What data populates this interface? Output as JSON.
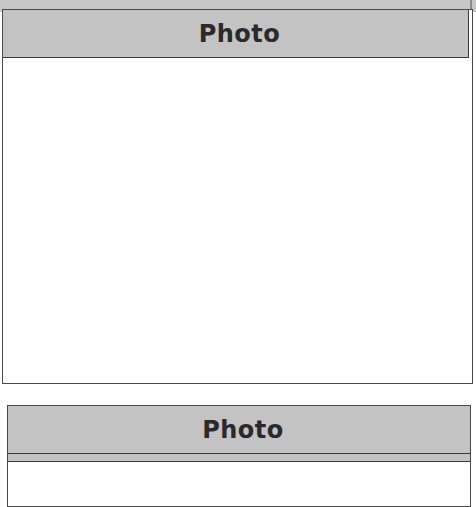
{
  "document": {
    "boxes": [
      {
        "header": "Photo",
        "content": ""
      },
      {
        "header": "Photo",
        "content": ""
      }
    ]
  },
  "colors": {
    "header_bg": "#c3c3c3",
    "border": "#3a3a3a",
    "page_bg": "#ffffff"
  }
}
